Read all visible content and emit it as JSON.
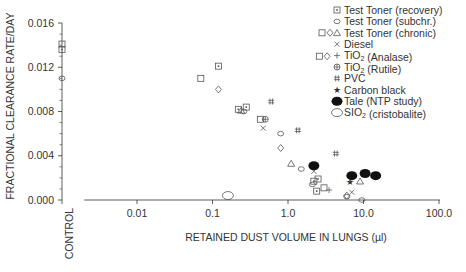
{
  "chart_data": {
    "type": "scatter",
    "title": "",
    "xlabel": "RETAINED DUST VOLUME IN LUNGS (µl)",
    "ylabel": "FRACTIONAL CLEARANCE RATE/DAY",
    "x_scale": "log",
    "xlim": [
      0.002,
      100.0
    ],
    "ylim": [
      0.0,
      0.016
    ],
    "x_ticks": [
      "0.01",
      "0.1",
      "1.0",
      "10.0",
      "100.0"
    ],
    "x_tick_values": [
      0.01,
      0.1,
      1.0,
      10.0,
      100.0
    ],
    "y_ticks": [
      "0.000",
      "0.004",
      "0.008",
      "0.012",
      "0.016"
    ],
    "y_tick_values": [
      0.0,
      0.004,
      0.008,
      0.012,
      0.016
    ],
    "control_label": "CONTROL",
    "grid": false,
    "legend_position": "upper right",
    "series": [
      {
        "name": "Test Toner (recovery)",
        "marker": "square-dot",
        "points": [
          [
            0.12,
            0.0121
          ],
          [
            0.22,
            0.0082
          ],
          [
            0.28,
            0.0084
          ],
          [
            2.2,
            0.0017
          ],
          [
            2.4,
            0.0008
          ],
          [
            2.5,
            0.0019
          ]
        ],
        "control": [
          0.0136
        ]
      },
      {
        "name": "Test Toner (subchr.)",
        "marker": "circle-small",
        "points": [
          [
            0.26,
            0.008
          ],
          [
            0.8,
            0.006
          ],
          [
            1.5,
            0.0028
          ],
          [
            2.1,
            0.0014
          ],
          [
            6.0,
            0.0003
          ],
          [
            9.5,
            0.0
          ]
        ],
        "control": [
          0.011
        ]
      },
      {
        "name": "Test Toner (chronic)",
        "marker": "triangle",
        "points": [
          [
            0.24,
            0.0081
          ],
          [
            1.1,
            0.0033
          ],
          [
            9.0,
            0.0017
          ]
        ],
        "control": []
      },
      {
        "name": "Test Toner (open square)",
        "marker": "square",
        "points": [
          [
            0.07,
            0.011
          ],
          [
            0.43,
            0.0073
          ],
          [
            2.6,
            0.013
          ],
          [
            3.0,
            0.0011
          ]
        ],
        "control": [
          0.0141
        ]
      },
      {
        "name": "Test Toner (diamond)",
        "marker": "diamond",
        "points": [
          [
            0.12,
            0.01
          ],
          [
            0.8,
            0.0047
          ],
          [
            3.3,
            0.013
          ],
          [
            6.0,
            0.0004
          ]
        ],
        "control": []
      },
      {
        "name": "Diesel",
        "marker": "x",
        "points": [
          [
            0.47,
            0.0065
          ],
          [
            2.2,
            0.0026
          ],
          [
            7.0,
            0.0007
          ]
        ],
        "control": []
      },
      {
        "name": "TiO₂ (Analase)",
        "marker": "plus",
        "points": [
          [
            3.5,
            0.0009
          ]
        ],
        "control": []
      },
      {
        "name": "TiO₂ (Rutile)",
        "marker": "circle-plus",
        "points": [
          [
            0.5,
            0.0073
          ]
        ],
        "control": []
      },
      {
        "name": "PVC",
        "marker": "hash",
        "points": [
          [
            0.6,
            0.0089
          ],
          [
            1.35,
            0.0063
          ],
          [
            4.3,
            0.0042
          ]
        ],
        "control": []
      },
      {
        "name": "Carbon black",
        "marker": "star",
        "points": [
          [
            6.7,
            0.0016
          ]
        ],
        "control": []
      },
      {
        "name": "Tale (NTP study)",
        "marker": "filled-ellipse",
        "points": [
          [
            2.2,
            0.0031
          ],
          [
            7.0,
            0.0022
          ],
          [
            10.5,
            0.0024
          ],
          [
            14.5,
            0.0022
          ]
        ],
        "control": []
      },
      {
        "name": "SIO₂ (cristobalite)",
        "marker": "open-ellipse",
        "points": [
          [
            0.16,
            0.0004
          ]
        ],
        "control": []
      }
    ],
    "legend": [
      {
        "label": "Test Toner (recovery)",
        "marker": "square-dot"
      },
      {
        "label": "Test Toner (subchr.)",
        "marker": "circle-small"
      },
      {
        "label": "Test Toner (chronic)",
        "marker": "triangle"
      },
      {
        "label": "Diesel",
        "marker": "x"
      },
      {
        "label": "TiO₂ (Analase)",
        "marker": "plus"
      },
      {
        "label": "TiO₂ (Rutile)",
        "marker": "circle-plus"
      },
      {
        "label": "PVC",
        "marker": "hash"
      },
      {
        "label": "Carbon black",
        "marker": "star"
      },
      {
        "label": "Tale (NTP study)",
        "marker": "filled-ellipse"
      },
      {
        "label": "SIO₂ (cristobalite)",
        "marker": "open-ellipse"
      }
    ],
    "legend_extra_markers": [
      "square",
      "diamond"
    ]
  },
  "colors": {
    "ink": "#333333",
    "marker": "#555555",
    "background": "#ffffff"
  }
}
